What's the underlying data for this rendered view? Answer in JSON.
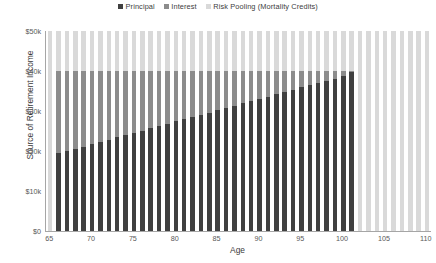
{
  "chart_data": {
    "type": "bar",
    "title": "",
    "stacked": true,
    "xlabel": "Age",
    "ylabel": "Source of Retirement Income",
    "xlim": [
      65,
      110
    ],
    "ylim": [
      0,
      50000
    ],
    "y_tick_labels": [
      "$0",
      "$10k",
      "$20k",
      "$30k",
      "$40k",
      "$50k"
    ],
    "y_tick_values": [
      0,
      10000,
      20000,
      30000,
      40000,
      50000
    ],
    "x_tick_labels": [
      "65",
      "70",
      "75",
      "80",
      "85",
      "90",
      "95",
      "100",
      "105",
      "110"
    ],
    "x_tick_values": [
      65,
      70,
      75,
      80,
      85,
      90,
      95,
      100,
      105,
      110
    ],
    "grid": false,
    "legend_position": "top-center",
    "categories": [
      65,
      66,
      67,
      68,
      69,
      70,
      71,
      72,
      73,
      74,
      75,
      76,
      77,
      78,
      79,
      80,
      81,
      82,
      83,
      84,
      85,
      86,
      87,
      88,
      89,
      90,
      91,
      92,
      93,
      94,
      95,
      96,
      97,
      98,
      99,
      100,
      101,
      102,
      103,
      104,
      105,
      106,
      107,
      108,
      109,
      110
    ],
    "series": [
      {
        "name": "Principal",
        "color": "#404040",
        "values": [
          0,
          19500,
          20000,
          20600,
          21100,
          21700,
          22300,
          22800,
          23400,
          24000,
          24500,
          25100,
          25700,
          26200,
          26800,
          27400,
          27900,
          28500,
          29100,
          29600,
          30200,
          30800,
          31300,
          31900,
          32500,
          33000,
          33600,
          34200,
          34700,
          35300,
          35900,
          36400,
          37000,
          37600,
          38100,
          38700,
          39800,
          0,
          0,
          0,
          0,
          0,
          0,
          0,
          0,
          0
        ]
      },
      {
        "name": "Interest",
        "color": "#8c8c8c",
        "values": [
          0,
          20500,
          20000,
          19400,
          18900,
          18300,
          17700,
          17200,
          16600,
          16000,
          15500,
          14900,
          14300,
          13800,
          13200,
          12600,
          12100,
          11500,
          10900,
          10400,
          9800,
          9200,
          8700,
          8100,
          7500,
          7000,
          6400,
          5800,
          5300,
          4700,
          4100,
          3600,
          3000,
          2400,
          1900,
          1300,
          200,
          0,
          0,
          0,
          0,
          0,
          0,
          0,
          0,
          0
        ]
      },
      {
        "name": "Risk Pooling (Mortality Credits)",
        "color": "#d9d9d9",
        "values": [
          50000,
          10000,
          10000,
          10000,
          10000,
          10000,
          10000,
          10000,
          10000,
          10000,
          10000,
          10000,
          10000,
          10000,
          10000,
          10000,
          10000,
          10000,
          10000,
          10000,
          10000,
          10000,
          10000,
          10000,
          10000,
          10000,
          10000,
          10000,
          10000,
          10000,
          10000,
          10000,
          10000,
          10000,
          10000,
          10000,
          10000,
          50000,
          50000,
          50000,
          50000,
          50000,
          50000,
          50000,
          50000,
          50000
        ]
      }
    ]
  },
  "legend": {
    "items": [
      {
        "label": "Principal",
        "color": "#404040"
      },
      {
        "label": "Interest",
        "color": "#8c8c8c"
      },
      {
        "label": "Risk Pooling (Mortality Credits)",
        "color": "#d9d9d9"
      }
    ]
  },
  "axes": {
    "y_title": "Source of Retirement Income",
    "x_title": "Age"
  }
}
